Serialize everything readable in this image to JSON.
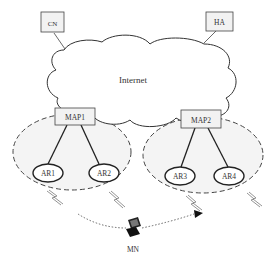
{
  "diagram": {
    "nodes": {
      "cn": "CN",
      "ha": "HA",
      "internet": "Internet",
      "map1": "MAP1",
      "map2": "MAP2",
      "ar1": "AR1",
      "ar2": "AR2",
      "ar3": "AR3",
      "ar4": "AR4",
      "mn": "MN"
    },
    "edges": [
      {
        "from": "CN",
        "to": "Internet",
        "style": "solid"
      },
      {
        "from": "HA",
        "to": "Internet",
        "style": "solid"
      },
      {
        "from": "MAP1",
        "to": "AR1",
        "style": "solid"
      },
      {
        "from": "MAP1",
        "to": "AR2",
        "style": "solid"
      },
      {
        "from": "MAP2",
        "to": "AR3",
        "style": "solid"
      },
      {
        "from": "MAP2",
        "to": "AR4",
        "style": "solid"
      },
      {
        "from": "MN",
        "to": "AR3",
        "style": "dotted-arrow",
        "meaning": "movement path"
      }
    ],
    "domains": [
      {
        "name": "MAP1 domain",
        "members": [
          "MAP1",
          "AR1",
          "AR2"
        ],
        "style": "dashed-ellipse"
      },
      {
        "name": "MAP2 domain",
        "members": [
          "MAP2",
          "AR3",
          "AR4"
        ],
        "style": "dashed-ellipse"
      }
    ],
    "colors": {
      "stroke": "#333333",
      "box_fill": "#f2f2f2",
      "domain_fill": "#f4f4f4",
      "background": "#ffffff"
    }
  }
}
